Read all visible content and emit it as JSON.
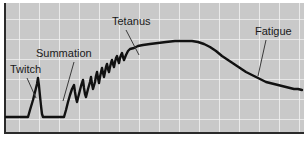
{
  "figure": {
    "background_color": "#ffffff",
    "plot_background_color": "#c9c9c9",
    "grid_color": "#f2f2f2",
    "curve_color": "#111111",
    "border_color": "#2b2b2b",
    "leader_color": "#3a3a3a"
  },
  "annotations": {
    "twitch": {
      "label": "Twitch"
    },
    "summation": {
      "label": "Summation"
    },
    "tetanus": {
      "label": "Tetanus"
    },
    "fatigue": {
      "label": "Fatigue"
    }
  },
  "chart_data": {
    "type": "line",
    "xlabel": "",
    "ylabel": "",
    "grid": true,
    "legend": "none",
    "xlim": [
      0,
      300
    ],
    "ylim": [
      0,
      130
    ],
    "axis_note": "y inverted in pixel space: larger pixel y = lower force",
    "grid_spacing_x": 20,
    "grid_spacing_y": 20,
    "annotations": [
      {
        "label": "Twitch",
        "text_xy": [
          10,
          73
        ],
        "leader_from": [
          27,
          78
        ],
        "leader_to": [
          36,
          98
        ]
      },
      {
        "label": "Summation",
        "text_xy": [
          36,
          57
        ],
        "leader_from": [
          74,
          62
        ],
        "leader_to": [
          63,
          101
        ]
      },
      {
        "label": "Tetanus",
        "text_xy": [
          112,
          25
        ],
        "leader_from": [
          126,
          30
        ],
        "leader_to": [
          139,
          55
        ]
      },
      {
        "label": "Fatigue",
        "text_xy": [
          255,
          35
        ],
        "leader_from": [
          266,
          40
        ],
        "leader_to": [
          258,
          76
        ]
      }
    ],
    "series": [
      {
        "name": "force",
        "points": [
          [
            6,
            117
          ],
          [
            12,
            117
          ],
          [
            18,
            117
          ],
          [
            24,
            117
          ],
          [
            28,
            117
          ],
          [
            30,
            110
          ],
          [
            33,
            100
          ],
          [
            35,
            92
          ],
          [
            37,
            84
          ],
          [
            38,
            78
          ],
          [
            39,
            86
          ],
          [
            40,
            96
          ],
          [
            41,
            106
          ],
          [
            42,
            114
          ],
          [
            43,
            117
          ],
          [
            50,
            117
          ],
          [
            56,
            117
          ],
          [
            61,
            117
          ],
          [
            64,
            117
          ],
          [
            66,
            110
          ],
          [
            68,
            102
          ],
          [
            70,
            95
          ],
          [
            72,
            89
          ],
          [
            74,
            85
          ],
          [
            75,
            92
          ],
          [
            76,
            98
          ],
          [
            77,
            102
          ],
          [
            79,
            94
          ],
          [
            81,
            86
          ],
          [
            83,
            80
          ],
          [
            84,
            88
          ],
          [
            85,
            94
          ],
          [
            86,
            97
          ],
          [
            88,
            89
          ],
          [
            90,
            82
          ],
          [
            91,
            77
          ],
          [
            92,
            84
          ],
          [
            93,
            89
          ],
          [
            95,
            82
          ],
          [
            96,
            76
          ],
          [
            97,
            72
          ],
          [
            98,
            78
          ],
          [
            99,
            83
          ],
          [
            100,
            77
          ],
          [
            101,
            72
          ],
          [
            102,
            68
          ],
          [
            103,
            73
          ],
          [
            104,
            77
          ],
          [
            105,
            72
          ],
          [
            106,
            67
          ],
          [
            107,
            64
          ],
          [
            108,
            69
          ],
          [
            109,
            72
          ],
          [
            110,
            67
          ],
          [
            111,
            63
          ],
          [
            112,
            60
          ],
          [
            113,
            64
          ],
          [
            114,
            67
          ],
          [
            115,
            62
          ],
          [
            116,
            58
          ],
          [
            117,
            56
          ],
          [
            118,
            60
          ],
          [
            119,
            63
          ],
          [
            120,
            58
          ],
          [
            121,
            55
          ],
          [
            122,
            53
          ],
          [
            123,
            57
          ],
          [
            124,
            60
          ],
          [
            126,
            55
          ],
          [
            128,
            51
          ],
          [
            130,
            49
          ],
          [
            134,
            48
          ],
          [
            138,
            46
          ],
          [
            143,
            45
          ],
          [
            150,
            44
          ],
          [
            158,
            43
          ],
          [
            166,
            42
          ],
          [
            175,
            41
          ],
          [
            184,
            41
          ],
          [
            192,
            41
          ],
          [
            198,
            42
          ],
          [
            204,
            44
          ],
          [
            210,
            47
          ],
          [
            216,
            51
          ],
          [
            222,
            56
          ],
          [
            228,
            60
          ],
          [
            234,
            64
          ],
          [
            240,
            68
          ],
          [
            246,
            72
          ],
          [
            252,
            75
          ],
          [
            258,
            78
          ],
          [
            262,
            80
          ],
          [
            266,
            82
          ],
          [
            270,
            83
          ],
          [
            274,
            84
          ],
          [
            278,
            85
          ],
          [
            282,
            86
          ],
          [
            286,
            87
          ],
          [
            290,
            88
          ],
          [
            294,
            89
          ],
          [
            298,
            89
          ],
          [
            302,
            90
          ]
        ]
      }
    ]
  }
}
